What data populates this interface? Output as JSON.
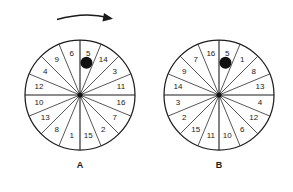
{
  "figure": {
    "background_color": "#ffffff",
    "line_color": "#1d1d1d",
    "marker_color": "#111111"
  },
  "rotation_arrow": {
    "name": "clockwise-rotation-arrow",
    "direction": "clockwise",
    "description": "curved arrow pointing right above wheel A"
  },
  "wheels": [
    {
      "id": "A",
      "label": "A",
      "center_x": 80,
      "center_y": 95,
      "radius": 55,
      "sector_count": 16,
      "marker": {
        "present": true,
        "in_sector_value": "5",
        "shape": "filled-circle",
        "radius": 6
      },
      "sectors_clockwise_from_top": [
        "5",
        "14",
        "3",
        "11",
        "16",
        "7",
        "2",
        "15",
        "1",
        "8",
        "13",
        "10",
        "12",
        "4",
        "9",
        "6"
      ]
    },
    {
      "id": "B",
      "label": "B",
      "center_x": 219,
      "center_y": 95,
      "radius": 55,
      "sector_count": 16,
      "marker": {
        "present": true,
        "in_sector_value": "5",
        "shape": "filled-circle",
        "radius": 6
      },
      "sectors_clockwise_from_top": [
        "5",
        "1",
        "8",
        "13",
        "4",
        "12",
        "6",
        "10",
        "11",
        "15",
        "2",
        "3",
        "14",
        "9",
        "7",
        "16"
      ]
    }
  ]
}
